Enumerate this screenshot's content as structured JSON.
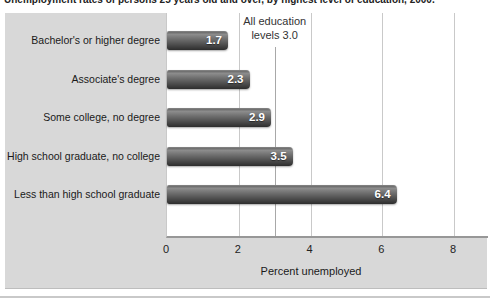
{
  "title": "Unemployment rates of persons 25 years old and over, by highest level of education, 2000.",
  "annotation": {
    "line1": "All education",
    "line2": "levels 3.0"
  },
  "x_axis": {
    "label": "Percent unemployed"
  },
  "chart_data": {
    "type": "bar",
    "orientation": "horizontal",
    "title": "Unemployment rates of persons 25 years old and over, by highest level of education, 2000.",
    "categories": [
      "Bachelor's or higher degree",
      "Associate's degree",
      "Some college, no degree",
      "High school graduate, no college",
      "Less than high school graduate"
    ],
    "values": [
      1.7,
      2.3,
      2.9,
      3.5,
      6.4
    ],
    "value_labels": [
      "1.7",
      "2.3",
      "2.9",
      "3.5",
      "6.4"
    ],
    "reference_line": {
      "label": "All education levels 3.0",
      "value": 3.0
    },
    "xlabel": "Percent unemployed",
    "ylabel": "",
    "xlim": [
      0,
      9
    ],
    "xticks": [
      0,
      2,
      4,
      6,
      8
    ],
    "grid": "vertical",
    "legend": "none",
    "colors": {
      "panel_background": "#d8d8d8",
      "plot_background": "#ffffff",
      "bar_dark": "#2d2d2d",
      "bar_light": "#8c8c8c",
      "gridline": "#c9c9c9",
      "value_label_text": "#ffffff"
    }
  }
}
